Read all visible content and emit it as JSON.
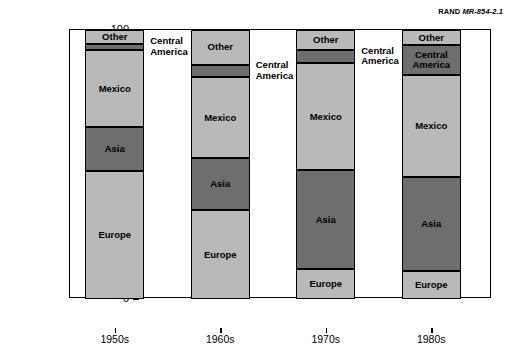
{
  "credit": {
    "org": "RAND",
    "report_id": "MR-854-2.1"
  },
  "chart_data": {
    "type": "bar",
    "subtype": "stacked-vertical-100",
    "title": "",
    "xlabel": "",
    "ylabel": "Share of arriving immigrants (percent)",
    "ylim": [
      0,
      100
    ],
    "yticks": [
      0,
      10,
      20,
      30,
      40,
      50,
      60,
      70,
      80,
      90,
      100
    ],
    "grid": false,
    "legend": "none (in-bar labels)",
    "categories": [
      "1950s",
      "1960s",
      "1970s",
      "1980s"
    ],
    "series": [
      {
        "name": "Europe",
        "values": [
          47.5,
          33.0,
          11.0,
          10.5
        ],
        "color": "#b9b9b9"
      },
      {
        "name": "Asia",
        "values": [
          16.5,
          19.4,
          37.0,
          34.8
        ],
        "color": "#6e6e6e"
      },
      {
        "name": "Mexico",
        "values": [
          28.4,
          30.0,
          39.6,
          37.9
        ],
        "color": "#b9b9b9"
      },
      {
        "name": "Central America",
        "values": [
          2.4,
          4.6,
          4.9,
          11.2
        ],
        "color": "#6e6e6e"
      },
      {
        "name": "Other",
        "values": [
          5.2,
          13.0,
          7.5,
          5.6
        ],
        "color": "#b9b9b9"
      }
    ],
    "annotations": [
      {
        "text": "Central\nAmerica",
        "for_category": "1950s"
      },
      {
        "text": "Central\nAmerica",
        "for_category": "1960s"
      },
      {
        "text": "Central\nAmerica",
        "for_category": "1970s"
      }
    ]
  },
  "labels": {
    "europe": "Europe",
    "asia": "Asia",
    "mexico": "Mexico",
    "central_america": "Central America",
    "central_america_wrapped": "Central\nAmerica",
    "other": "Other"
  },
  "ytick_labels": [
    "100",
    "90",
    "80",
    "70",
    "60",
    "50",
    "40",
    "30",
    "20",
    "10",
    "0"
  ],
  "xtick_labels": [
    "1950s",
    "1960s",
    "1970s",
    "1980s"
  ]
}
